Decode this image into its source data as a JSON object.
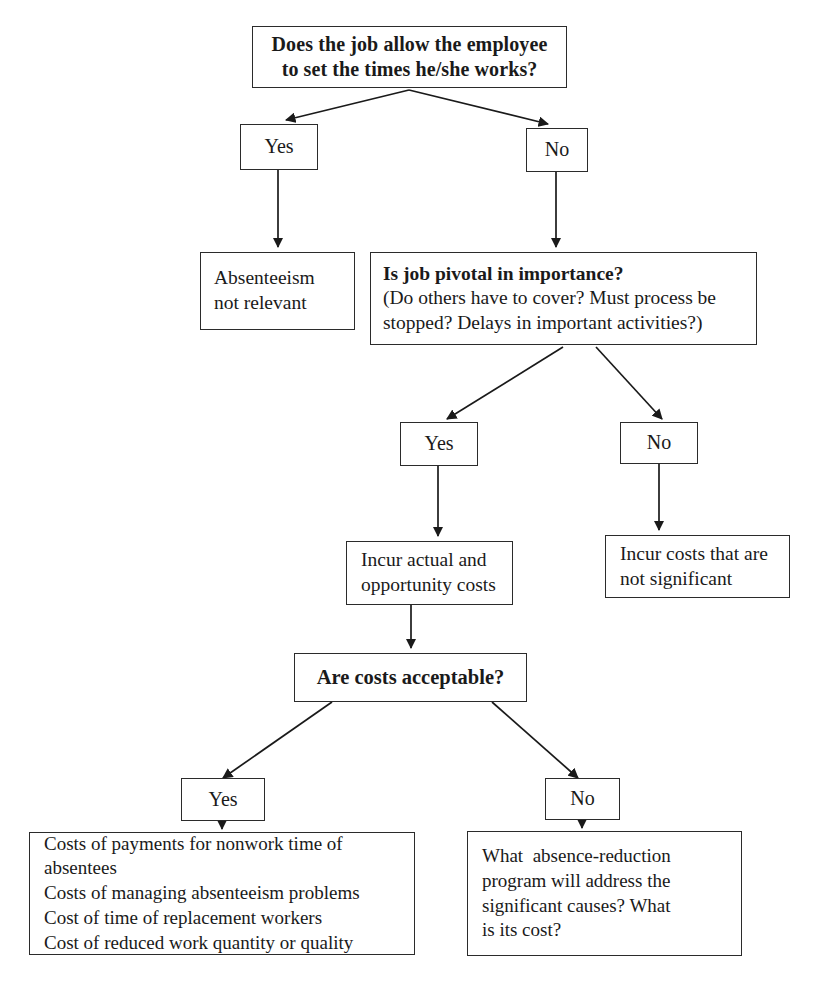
{
  "diagram": {
    "stroke_color": "#2b2b2b",
    "background_color": "#ffffff"
  },
  "nodes": {
    "q1": {
      "name": "question-job-flexible-hours",
      "lines": [
        "Does the job allow the employee",
        "to set the times he/she works?"
      ]
    },
    "q1_yes": {
      "label": "Yes"
    },
    "q1_no": {
      "label": "No"
    },
    "absenteeism_not_relevant": {
      "lines": [
        "Absenteeism",
        "not relevant"
      ]
    },
    "q2": {
      "heading": "Is job pivotal in importance?",
      "lines": [
        "(Do others have to cover? Must process be",
        "stopped? Delays in important activities?)"
      ]
    },
    "q2_yes": {
      "label": "Yes"
    },
    "q2_no": {
      "label": "No"
    },
    "incur_actual_costs": {
      "lines": [
        "Incur actual and",
        "opportunity costs"
      ]
    },
    "incur_not_significant": {
      "lines": [
        "Incur costs that are",
        "not significant"
      ]
    },
    "q3": {
      "label": "Are costs acceptable?"
    },
    "q3_yes": {
      "label": "Yes"
    },
    "q3_no": {
      "label": "No"
    },
    "cost_list": {
      "lines": [
        "Costs of payments for nonwork time of",
        "absentees",
        "Costs of managing absenteeism problems",
        "Cost of time of replacement workers",
        "Cost of reduced work quantity or quality"
      ]
    },
    "reduction_program": {
      "lines": [
        "What  absence-reduction",
        "program will address the",
        "significant causes? What",
        "is its cost?"
      ]
    }
  }
}
